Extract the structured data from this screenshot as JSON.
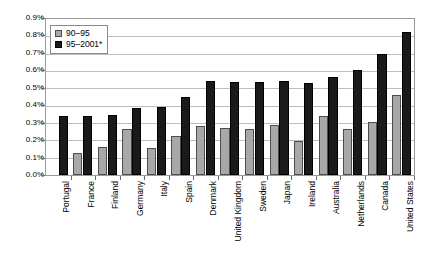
{
  "chart_data": {
    "type": "bar",
    "title": "",
    "subtitle": "",
    "xlabel": "",
    "ylabel": "",
    "ylim": [
      0,
      0.9
    ],
    "ytick_labels": [
      "0.9%",
      "0.8%",
      "0.7%",
      "0.6%",
      "0.5%",
      "0.4%",
      "0.3%",
      "0.2%",
      "0.1%",
      "0.0%"
    ],
    "ytick_values": [
      0.9,
      0.8,
      0.7,
      0.6,
      0.5,
      0.4,
      0.3,
      0.2,
      0.1,
      0.0
    ],
    "grid": true,
    "legend_position": "top-left",
    "categories": [
      "Portugal",
      "France",
      "Finland",
      "Germany",
      "Italy",
      "Spain",
      "Denmark",
      "United Kingdom",
      "Sweden",
      "Japan",
      "Ireland",
      "Australia",
      "Netherlands",
      "Canada",
      "United States"
    ],
    "series": [
      {
        "name": "90–95",
        "color": "#a8a8a8",
        "values": [
          0.0,
          0.13,
          0.16,
          0.27,
          0.155,
          0.225,
          0.285,
          0.275,
          0.265,
          0.29,
          0.2,
          0.345,
          0.27,
          0.31,
          0.465
        ]
      },
      {
        "name": "95–2001*",
        "color": "#1a1a1a",
        "values": [
          0.345,
          0.345,
          0.35,
          0.39,
          0.395,
          0.455,
          0.545,
          0.54,
          0.54,
          0.545,
          0.535,
          0.57,
          0.61,
          0.7,
          0.83
        ]
      }
    ]
  },
  "legend": {
    "items": [
      {
        "label": "90–95"
      },
      {
        "label": "95–2001*"
      }
    ]
  }
}
